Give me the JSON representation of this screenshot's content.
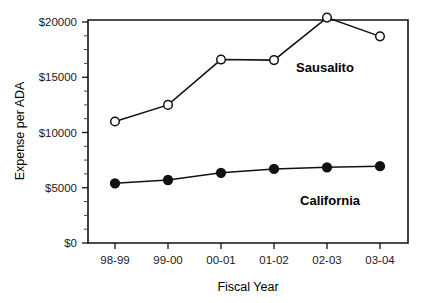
{
  "chart_data": {
    "type": "line",
    "title": "",
    "xlabel": "Fiscal Year",
    "ylabel": "Expense per ADA",
    "categories": [
      "98-99",
      "99-00",
      "00-01",
      "01-02",
      "02-03",
      "03-04"
    ],
    "series": [
      {
        "name": "Sausalito",
        "marker": "open-circle",
        "values": [
          11000,
          12500,
          16600,
          16550,
          20400,
          18700
        ]
      },
      {
        "name": "California",
        "marker": "filled-circle",
        "values": [
          5400,
          5700,
          6350,
          6700,
          6850,
          6950
        ]
      }
    ],
    "ylim": [
      0,
      21000
    ],
    "y_ticks": [
      0,
      5000,
      10000,
      15000,
      20000
    ],
    "y_tick_labels": [
      "$0",
      "$5000",
      "$10000",
      "$15000",
      "$20000"
    ],
    "y_minor_ticks": [
      1250,
      2500,
      3750,
      6250,
      7500,
      8750,
      11250,
      12500,
      13750,
      16250,
      17500,
      18750
    ],
    "grid": false,
    "legend_position": "inline-annotations",
    "annotations": [
      {
        "text": "Sausalito",
        "x_category": "02-03",
        "value": 15200
      },
      {
        "text": "California",
        "x_category": "02-03",
        "value": 3700
      }
    ],
    "colors": {
      "line": "#111111",
      "marker_open_fill": "#ffffff",
      "marker_filled_fill": "#111111",
      "axis": "#111111",
      "text": "#000000"
    }
  },
  "axes": {
    "y_labels": [
      "$20000",
      "$15000",
      "$10000",
      "$5000",
      "$0"
    ],
    "x_labels": [
      "98-99",
      "99-00",
      "00-01",
      "01-02",
      "02-03",
      "03-04"
    ],
    "y_title": "Expense per ADA",
    "x_title": "Fiscal Year"
  },
  "series_labels": {
    "sausalito": "Sausalito",
    "california": "California"
  }
}
